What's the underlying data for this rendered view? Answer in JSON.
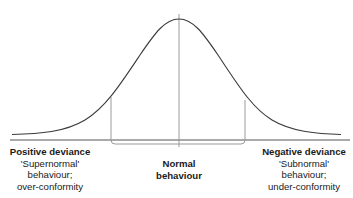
{
  "diagram": {
    "type": "normal-distribution-curve",
    "colors": {
      "curve": "#3a3a3a",
      "baseline": "#555555",
      "guides": "#9a9a9a",
      "text": "#1a1a1a"
    },
    "labels": {
      "left": {
        "title": "Positive deviance",
        "lines": [
          "'Supernormal'",
          "behaviour;",
          "over-conformity"
        ]
      },
      "center": {
        "lines": [
          "Normal",
          "behaviour"
        ]
      },
      "right": {
        "title": "Negative deviance",
        "lines": [
          "'Subnormal'",
          "behaviour;",
          "under-conformity"
        ]
      }
    }
  }
}
